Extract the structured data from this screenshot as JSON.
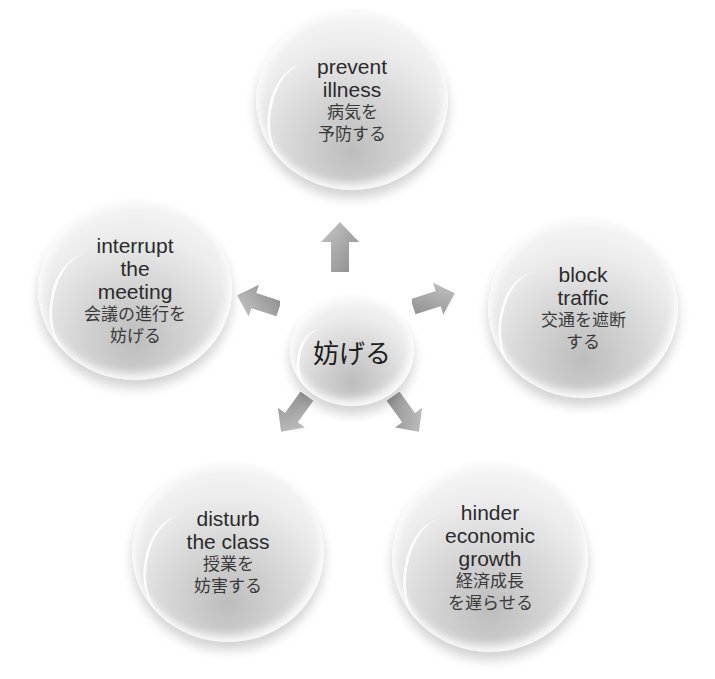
{
  "center": {
    "label": "妨げる"
  },
  "nodes": [
    {
      "id": "top",
      "en": [
        "prevent",
        "illness"
      ],
      "ja": [
        "病気を",
        "予防する"
      ]
    },
    {
      "id": "right",
      "en": [
        "block",
        "traffic"
      ],
      "ja": [
        "交通を遮断",
        "する"
      ]
    },
    {
      "id": "bottom-right",
      "en": [
        "hinder",
        "economic",
        "growth"
      ],
      "ja": [
        "経済成長",
        "を遅らせる"
      ]
    },
    {
      "id": "bottom-left",
      "en": [
        "disturb",
        "the class"
      ],
      "ja": [
        "授業を",
        "妨害する"
      ]
    },
    {
      "id": "left",
      "en": [
        "interrupt",
        "the",
        "meeting"
      ],
      "ja": [
        "会議の進行を",
        "妨げる"
      ]
    }
  ],
  "colors": {
    "arrow": "#9a9a9a",
    "text": "#2b2b2b",
    "background": "#ffffff"
  }
}
